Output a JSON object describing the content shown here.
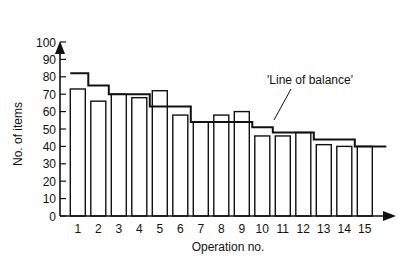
{
  "chart_data": {
    "type": "bar",
    "title": "",
    "xlabel": "Operation no.",
    "ylabel": "No. of items",
    "categories": [
      "1",
      "2",
      "3",
      "4",
      "5",
      "6",
      "7",
      "8",
      "9",
      "10",
      "11",
      "12",
      "13",
      "14",
      "15"
    ],
    "series": [
      {
        "name": "Items per operation (bars)",
        "type": "bar",
        "values": [
          73,
          66,
          70,
          68,
          72,
          58,
          54,
          58,
          60,
          46,
          46,
          48,
          41,
          40,
          40
        ]
      },
      {
        "name": "Line of balance",
        "type": "step",
        "values": [
          82,
          75,
          70,
          70,
          63,
          63,
          54,
          54,
          54,
          51,
          48,
          48,
          44,
          44,
          40
        ]
      }
    ],
    "yticks": [
      0,
      10,
      20,
      30,
      40,
      50,
      60,
      70,
      80,
      90,
      100
    ],
    "ylim": [
      0,
      100
    ],
    "grid": false,
    "legend": null,
    "annotations": [
      {
        "text": "'Line of balance'",
        "points_to": "step line near operation 10"
      }
    ]
  },
  "labels": {
    "ylabel": "No. of items",
    "xlabel": "Operation no.",
    "annotation": "'Line of balance'"
  },
  "colors": {
    "ink": "#111111",
    "background": "#ffffff"
  }
}
